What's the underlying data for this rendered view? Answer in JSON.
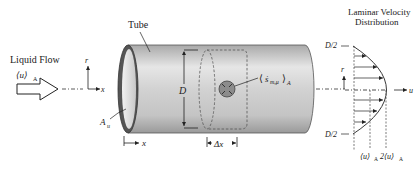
{
  "diagram": {
    "title_left": "Liquid Flow",
    "inlet_velocity": "⟨u⟩",
    "inlet_velocity_sub": "A",
    "tube_label": "Tube",
    "axis_r": "r",
    "axis_x": "x",
    "area_label": "A",
    "area_sub": "u",
    "diameter_label": "D",
    "source_label_open": "⟨",
    "source_symbol": "ṡ",
    "source_sub": "m,μ",
    "source_label_close": "⟩",
    "source_label_sub": "A",
    "x_marker": "x",
    "delta_x": "Δx",
    "profile_title_line1": "Laminar Velocity",
    "profile_title_line2": "Distribution",
    "profile_top": "D/2",
    "profile_bottom": "D/2",
    "profile_r": "r",
    "profile_u": "u",
    "mean_velocity": "⟨u⟩",
    "mean_velocity_sub": "A",
    "max_velocity": "2⟨u⟩",
    "max_velocity_sub": "A"
  }
}
